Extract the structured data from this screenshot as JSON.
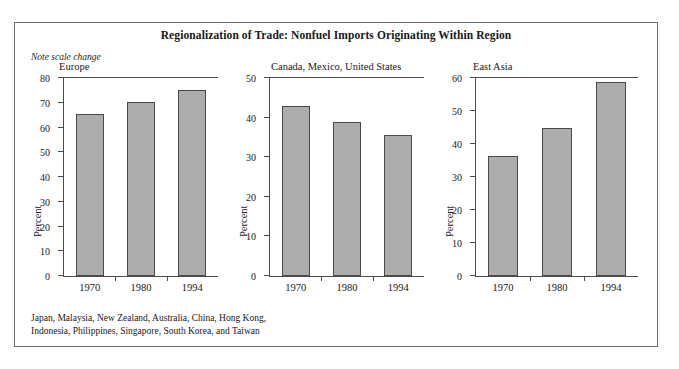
{
  "figure": {
    "title": "Regionalization of Trade: Nonfuel Imports Originating Within Region",
    "scale_note": "Note scale change",
    "footnote_line1": "Japan, Malaysia, New Zealand, Australia, China, Hong Kong,",
    "footnote_line2": "Indonesia, Philippines, Singapore, South Korea, and Taiwan",
    "bar_color": "#adadad",
    "bar_edge_color": "#4a4a4a",
    "axis_color": "#4d4d4d",
    "frame_color": "#6d6d6d",
    "background": "#ffffff"
  },
  "chart_data": [
    {
      "type": "bar",
      "title": "Europe",
      "xlabel": "",
      "ylabel": "Percent",
      "categories": [
        "1970",
        "1980",
        "1994"
      ],
      "values": [
        65.5,
        70.2,
        75.0
      ],
      "ylim": [
        0,
        80
      ],
      "yticks": [
        0,
        10,
        20,
        30,
        40,
        50,
        60,
        70,
        80
      ],
      "ytick_labels": [
        "0",
        "10",
        "20",
        "30",
        "40",
        "50",
        "60",
        "70",
        "80"
      ],
      "grid": false,
      "legend": "none"
    },
    {
      "type": "bar",
      "title": "Canada, Mexico, United States",
      "xlabel": "",
      "ylabel": "Percent",
      "categories": [
        "1970",
        "1980",
        "1994"
      ],
      "values": [
        43.0,
        39.0,
        35.5
      ],
      "ylim": [
        0,
        50
      ],
      "yticks": [
        0,
        10,
        20,
        30,
        40,
        50
      ],
      "ytick_labels": [
        "0",
        "10",
        "20",
        "30",
        "40",
        "50"
      ],
      "grid": false,
      "legend": "none"
    },
    {
      "type": "bar",
      "title": "East Asia",
      "xlabel": "",
      "ylabel": "Percent",
      "categories": [
        "1970",
        "1980",
        "1994"
      ],
      "values": [
        36.3,
        44.8,
        58.7
      ],
      "ylim": [
        0,
        60
      ],
      "yticks": [
        0,
        10,
        20,
        30,
        40,
        50,
        60
      ],
      "ytick_labels": [
        "0",
        "10",
        "20",
        "30",
        "40",
        "50",
        "60"
      ],
      "grid": false,
      "legend": "none"
    }
  ]
}
